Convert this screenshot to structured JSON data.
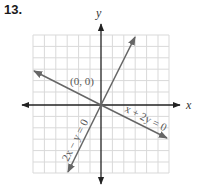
{
  "problem": {
    "number": "13."
  },
  "axes": {
    "x_label": "x",
    "y_label": "y"
  },
  "point_label": "(0, 0)",
  "lines": [
    {
      "equation": "x + 2y = 0",
      "slope": -0.5
    },
    {
      "equation": "2x − y = 0",
      "slope": 2
    }
  ],
  "grid": {
    "cells_per_side": 6,
    "range": [
      -6,
      6
    ]
  },
  "colors": {
    "grid": "#d9d9d9",
    "axis": "#222222",
    "line": "#666666"
  }
}
